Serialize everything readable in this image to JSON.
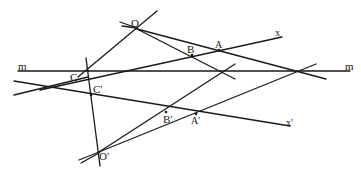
{
  "diagram": {
    "title": "",
    "labels": {
      "O": "O",
      "O_prime": "O′",
      "A": "A",
      "B": "B",
      "C": "C",
      "A_prime": "A′",
      "B_prime": "B′",
      "C_prime": "C′",
      "x": "x",
      "x_prime": "x′",
      "m_left": "m",
      "m_right": "m"
    },
    "points": {
      "O": [
        136,
        28
      ],
      "O_prime": [
        99,
        152
      ],
      "A": [
        219,
        50
      ],
      "B": [
        193,
        54
      ],
      "C": [
        88,
        71
      ],
      "A_prime": [
        196,
        114
      ],
      "B_prime": [
        166,
        112
      ],
      "C_prime": [
        92,
        95
      ]
    },
    "lines": [
      {
        "name": "line-m",
        "from": [
          18,
          71
        ],
        "to": [
          350,
          71
        ]
      },
      {
        "name": "ray-x",
        "from": [
          15,
          95
        ],
        "to": [
          282,
          37
        ]
      },
      {
        "name": "ray-x-prime",
        "from": [
          15,
          82
        ],
        "to": [
          290,
          126
        ]
      },
      {
        "name": "line-O-C",
        "from": [
          157,
          12
        ],
        "to": [
          78,
          77
        ]
      },
      {
        "name": "line-O-B",
        "from": [
          118,
          22
        ],
        "to": [
          232,
          80
        ]
      },
      {
        "name": "line-O-A",
        "from": [
          118,
          25
        ],
        "to": [
          326,
          78
        ]
      },
      {
        "name": "line-C-C-prime",
        "from": [
          86,
          58
        ],
        "to": [
          100,
          165
        ]
      },
      {
        "name": "line-O-prime-B-prime",
        "from": [
          78,
          160
        ],
        "to": [
          240,
          64
        ]
      },
      {
        "name": "line-O-prime-A-prime",
        "from": [
          80,
          163
        ],
        "to": [
          335,
          64
        ]
      },
      {
        "name": "line-C-axis",
        "from": [
          84,
          80
        ],
        "to": [
          340,
          60
        ]
      }
    ]
  }
}
